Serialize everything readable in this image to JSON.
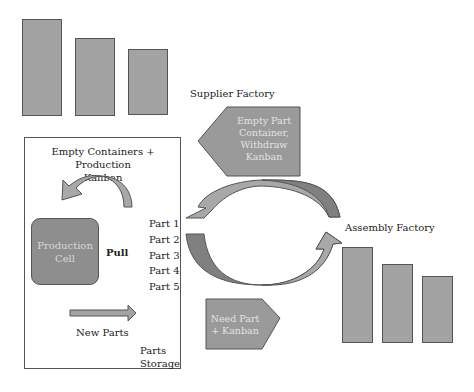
{
  "supplier": {
    "label": "Supplier Factory",
    "bars": 3
  },
  "withdraw_banner": {
    "text": "Empty Part\nContainer,\nWithdraw\nKanban",
    "direction": "left"
  },
  "parts_storage": {
    "heading": "Empty Containers + Production\nKanban",
    "production_cell": "Production\nCell",
    "pull_label": "Pull",
    "parts": [
      "Part 1",
      "Part 2",
      "Part 3",
      "Part 4",
      "Part 5"
    ],
    "new_parts_label": "New Parts",
    "storage_label": "Parts\nStorage"
  },
  "need_banner": {
    "text": "Need Part\n+ Kanban",
    "direction": "right"
  },
  "assembly": {
    "label": "Assembly Factory",
    "bars": 3
  },
  "colors": {
    "bar_fill": "#a3a3a3",
    "arrow_light": "#a8a8a8",
    "arrow_dark": "#7c7c7c",
    "banner_fill": "#9a9a9a",
    "outline": "#555555"
  }
}
